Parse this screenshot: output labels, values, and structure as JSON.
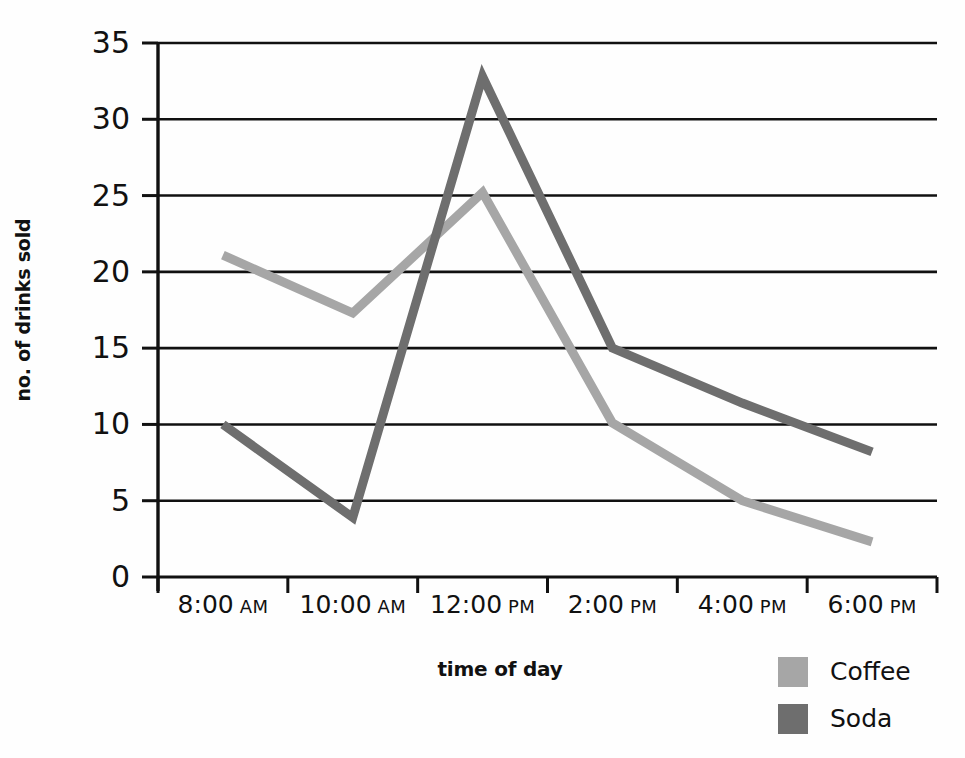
{
  "chart_data": {
    "type": "line",
    "title": "",
    "xlabel": "time of day",
    "ylabel": "no. of drinks sold",
    "categories": [
      "8:00 AM",
      "10:00 AM",
      "12:00 PM",
      "2:00 PM",
      "4:00 PM",
      "6:00 PM"
    ],
    "x_tick_labels": [
      {
        "time": "8:00",
        "meridiem": "AM"
      },
      {
        "time": "10:00",
        "meridiem": "AM"
      },
      {
        "time": "12:00",
        "meridiem": "PM"
      },
      {
        "time": "2:00",
        "meridiem": "PM"
      },
      {
        "time": "4:00",
        "meridiem": "PM"
      },
      {
        "time": "6:00",
        "meridiem": "PM"
      }
    ],
    "y_ticks": [
      0,
      5,
      10,
      15,
      20,
      25,
      30,
      35
    ],
    "ylim": [
      0,
      35
    ],
    "grid": true,
    "legend_position": "bottom-right",
    "series": [
      {
        "name": "Coffee",
        "color": "#a6a6a6",
        "values": [
          21.1,
          17.3,
          25.2,
          10.1,
          5.0,
          2.3
        ]
      },
      {
        "name": "Soda",
        "color": "#6e6e6e",
        "values": [
          10.0,
          3.9,
          32.8,
          15.0,
          11.4,
          8.2
        ]
      }
    ]
  },
  "legend": {
    "items": [
      {
        "label": "Coffee",
        "color": "#a6a6a6"
      },
      {
        "label": "Soda",
        "color": "#6e6e6e"
      }
    ]
  },
  "axes": {
    "y_title": "no. of drinks sold",
    "x_title": "time of day",
    "axis_color": "#111111",
    "grid_color": "#111111"
  }
}
